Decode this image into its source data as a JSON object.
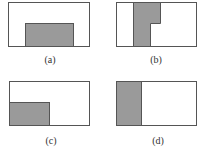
{
  "figure": {
    "colors": {
      "outline": "#555555",
      "fill": "#9a9a9a",
      "background": "#ffffff"
    },
    "panels": [
      {
        "id": "a",
        "label": "(a)",
        "box": [
          8,
          2,
          81,
          44
        ],
        "shaded": "bottom-center rectangle"
      },
      {
        "id": "b",
        "label": "(b)",
        "box": [
          116,
          2,
          80,
          44
        ],
        "shaded": "vertical stepped strip, wider at top"
      },
      {
        "id": "c",
        "label": "(c)",
        "box": [
          9,
          81,
          80,
          44
        ],
        "shaded": "bottom-left rectangle"
      },
      {
        "id": "d",
        "label": "(d)",
        "box": [
          116,
          81,
          80,
          44
        ],
        "shaded": "left full-height strip"
      }
    ]
  }
}
